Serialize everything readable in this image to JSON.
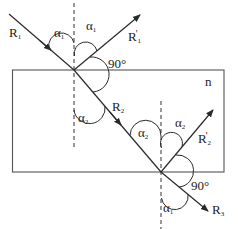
{
  "diagram": {
    "title": "",
    "colors": {
      "stroke": "#2a2a2a",
      "background": "#ffffff"
    },
    "medium": {
      "label": "n"
    },
    "rays": [
      {
        "id": "R1",
        "base": "R",
        "sub": "1",
        "prime": "",
        "role": "incident ray"
      },
      {
        "id": "R1p",
        "base": "R",
        "sub": "1",
        "prime": "'",
        "role": "reflected ray at top surface"
      },
      {
        "id": "R2",
        "base": "R",
        "sub": "2",
        "prime": "",
        "role": "refracted ray inside slab"
      },
      {
        "id": "R2p",
        "base": "R",
        "sub": "2",
        "prime": "'",
        "role": "ray leaving slab at bottom surface (upward)"
      },
      {
        "id": "R3",
        "base": "R",
        "sub": "3",
        "prime": "",
        "role": "transmitted ray below slab"
      }
    ],
    "angles": [
      {
        "id": "a1_incident",
        "base": "α",
        "sub": "1"
      },
      {
        "id": "a1_reflected",
        "base": "α",
        "sub": "1"
      },
      {
        "id": "right_angle_top",
        "text": "90°"
      },
      {
        "id": "a2_top",
        "base": "α",
        "sub": "2"
      },
      {
        "id": "a2_bottom_left",
        "base": "α",
        "sub": "2"
      },
      {
        "id": "a2_bottom_right",
        "base": "α",
        "sub": "2"
      },
      {
        "id": "right_angle_bottom",
        "text": "90°"
      },
      {
        "id": "a1_exit",
        "base": "α",
        "sub": "1"
      }
    ]
  }
}
